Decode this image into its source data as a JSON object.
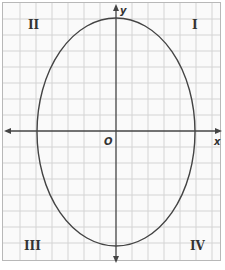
{
  "diagram": {
    "type": "coordinate-plane-ellipse",
    "axes": {
      "x_label": "x",
      "y_label": "y",
      "origin_label": "O"
    },
    "quadrants": [
      {
        "id": "I",
        "label": "I"
      },
      {
        "id": "II",
        "label": "II"
      },
      {
        "id": "III",
        "label": "III"
      },
      {
        "id": "IV",
        "label": "IV"
      }
    ],
    "ellipse": {
      "center": [
        0,
        0
      ],
      "semi_major_axis": "vertical",
      "note": "vertically elongated ellipse centered at origin"
    },
    "colors": {
      "grid": "#d0d0d0",
      "curve": "#444444",
      "axes": "#444444"
    }
  }
}
